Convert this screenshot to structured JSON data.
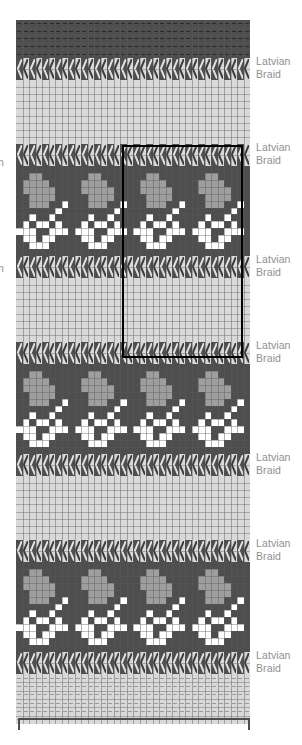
{
  "chart_data": {
    "type": "heatmap",
    "columns": 36,
    "rows": 100,
    "xlabel": "",
    "ylabel": "",
    "grid": true,
    "legend_position": "right",
    "palette": {
      "dark": "#4e4e4e",
      "light": "#d9d9d9",
      "medium": "#9e9e9e",
      "white": "#ffffff",
      "grid_line": "#5a5a5a",
      "highlight_border": "#000000",
      "label_text": "#8f8f8f",
      "bracket": "#4d4d4d"
    },
    "bands": [
      {
        "id": "band-dark-purl-top",
        "kind": "purl",
        "base": "dark",
        "rows": 5,
        "height": 38,
        "label": null
      },
      {
        "id": "band-braid-1",
        "kind": "braid",
        "rows": 2,
        "height": 22,
        "label": "Latvian\nBraid"
      },
      {
        "id": "band-light-1",
        "kind": "plain",
        "base": "light",
        "rows": 9,
        "height": 64,
        "label": null
      },
      {
        "id": "band-braid-2",
        "kind": "braid",
        "rows": 2,
        "height": 22,
        "label": "Latvian\nBraid"
      },
      {
        "id": "band-motif-1",
        "kind": "motif",
        "rows": 13,
        "height": 90,
        "label": null
      },
      {
        "id": "band-braid-3",
        "kind": "braid",
        "rows": 2,
        "height": 22,
        "label": "Latvian\nBraid"
      },
      {
        "id": "band-light-2",
        "kind": "plain",
        "base": "light",
        "rows": 9,
        "height": 64,
        "label": null
      },
      {
        "id": "band-braid-4",
        "kind": "braid",
        "rows": 2,
        "height": 22,
        "label": "Latvian\nBraid"
      },
      {
        "id": "band-motif-2",
        "kind": "motif",
        "rows": 13,
        "height": 90,
        "label": null
      },
      {
        "id": "band-braid-5",
        "kind": "braid",
        "rows": 2,
        "height": 22,
        "label": "Latvian\nBraid"
      },
      {
        "id": "band-light-3",
        "kind": "plain",
        "base": "light",
        "rows": 9,
        "height": 64,
        "label": null
      },
      {
        "id": "band-braid-6",
        "kind": "braid",
        "rows": 2,
        "height": 22,
        "label": "Latvian\nBraid"
      },
      {
        "id": "band-motif-3",
        "kind": "motif",
        "rows": 13,
        "height": 90,
        "label": null
      },
      {
        "id": "band-braid-7",
        "kind": "braid",
        "rows": 2,
        "height": 22,
        "label": "Latvian\nBraid"
      },
      {
        "id": "band-light-purl-bottom",
        "kind": "purl",
        "base": "light",
        "rows": 6,
        "height": 50,
        "label": null
      }
    ],
    "motif": {
      "name": "floral-butterfly",
      "repeat_width": 9,
      "repeats_across": 4,
      "rows": 13,
      "legend": {
        "D": "dark",
        "M": "medium",
        "W": "white"
      },
      "cells": [
        "DDDDDDDDD",
        "DDMMDDDDD",
        "DMMMMDDDD",
        "DMMMMMDDD",
        "DDMMMMDDD",
        "DDMMMDDWD",
        "DDDDDDWDD",
        "DDWDDWDDD",
        "DWDWWDWDD",
        "WWWDDWWWD",
        "DWWDWWDDD",
        "DDWWWDDDD",
        "DDDDDDDDD"
      ]
    },
    "braid": {
      "glyph": "chevron-left",
      "repeat": 2,
      "description": "alternating dark and light columns each bearing a left-pointing chevron"
    },
    "highlight": {
      "present": true,
      "label": "pattern repeat box",
      "x": 122,
      "y": 145,
      "width": 121,
      "height": 213
    },
    "bracket": {
      "present": true,
      "label": "",
      "orientation": "bottom",
      "x": 18,
      "y": 718,
      "width": 232,
      "height": 12
    }
  },
  "labels": {
    "latvian_braid": "Latvian\nBraid",
    "left_clipped": "n"
  }
}
